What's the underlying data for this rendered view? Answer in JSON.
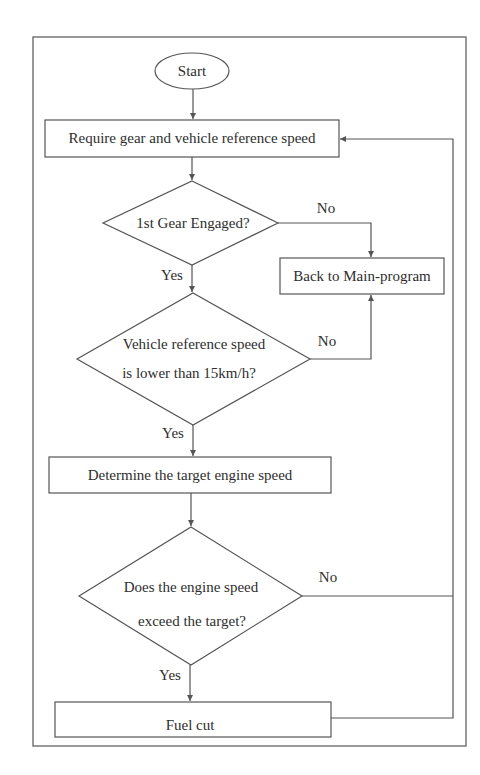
{
  "flowchart": {
    "nodes": {
      "start": {
        "type": "terminator",
        "label": "Start"
      },
      "require": {
        "type": "process",
        "label": "Require gear and vehicle reference speed"
      },
      "gear_check": {
        "type": "decision",
        "label": "1st Gear Engaged?"
      },
      "back_main": {
        "type": "process",
        "label": "Back to Main-program"
      },
      "speed_check": {
        "type": "decision",
        "label_line1": "Vehicle reference speed",
        "label_line2": "is lower than 15km/h?"
      },
      "determine": {
        "type": "process",
        "label": "Determine the target engine speed"
      },
      "engine_check": {
        "type": "decision",
        "label_line1": "Does the engine speed",
        "label_line2": "exceed the target?"
      },
      "fuel_cut": {
        "type": "process",
        "label": "Fuel cut"
      }
    },
    "edges": {
      "gear_no": "No",
      "gear_yes": "Yes",
      "speed_no": "No",
      "speed_yes": "Yes",
      "engine_no": "No",
      "engine_yes": "Yes"
    },
    "colors": {
      "stroke": "#555555",
      "background": "#ffffff",
      "text": "#2e2e2e"
    }
  }
}
